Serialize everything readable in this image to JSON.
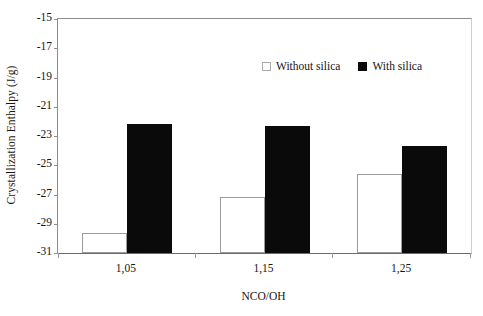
{
  "chart_data": {
    "type": "bar",
    "title": "",
    "categories": [
      "1,05",
      "1,15",
      "1,25"
    ],
    "series": [
      {
        "name": "Without silica",
        "values": [
          -29.6,
          -27.2,
          -25.6
        ],
        "color": "#ffffff",
        "edge_color": "#9b9b9b"
      },
      {
        "name": "With silica",
        "values": [
          -22.2,
          -22.3,
          -23.7
        ],
        "color": "#0a0a0a",
        "edge_color": "#0a0a0a"
      }
    ],
    "xlabel": "NCO/OH",
    "ylabel": "Crystallization Enthalpy (J/g)",
    "ylim": [
      -31,
      -15
    ],
    "ytick_step": 2,
    "yticks": [
      -15,
      -17,
      -19,
      -21,
      -23,
      -25,
      -27,
      -29,
      -31
    ],
    "ytick_labels": [
      "-15",
      "-17",
      "-19",
      "-21",
      "-23",
      "-25",
      "-27",
      "-29",
      "-31"
    ],
    "grid": false,
    "legend_position": "upper-center-right",
    "baseline_value": -31
  },
  "axes": {
    "y_title": "Crystallization Enthalpy (J/g)",
    "x_title": "NCO/OH"
  },
  "legend": {
    "entries": [
      {
        "label": "Without silica",
        "marker": "hollow-square-marker"
      },
      {
        "label": "With silica",
        "marker": "filled-square-marker"
      }
    ]
  }
}
